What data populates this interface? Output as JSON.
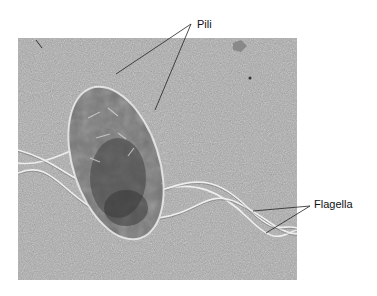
{
  "figure": {
    "type": "electron micrograph",
    "labels": [
      {
        "id": "pili",
        "text": "Pili",
        "x": 197,
        "y": 19,
        "pointers": [
          [
            116,
            74
          ],
          [
            155,
            110
          ]
        ]
      },
      {
        "id": "flagella",
        "text": "Flagella",
        "x": 314,
        "y": 203,
        "pointers": [
          [
            253,
            211
          ],
          [
            266,
            233
          ]
        ]
      }
    ],
    "colors": {
      "background": "#ffffff",
      "micrograph_base": "#a9a9a9",
      "cell_body": "#6e6e6e",
      "cell_dark": "#3f3f3f",
      "cell_outline": "#e6e6e6",
      "flagella": "#eeeeee",
      "leader_line": "#222222"
    }
  }
}
